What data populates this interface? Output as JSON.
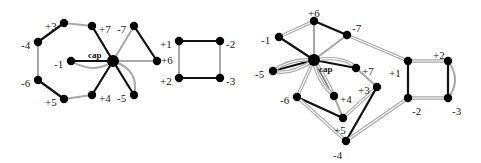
{
  "colors": {
    "black": "#111111",
    "gray": "#a8a8a8",
    "node": "#000000"
  },
  "diagrams": [
    {
      "name": "left-graph",
      "nodes": [
        {
          "id": "p3",
          "label": "+3",
          "x": 64,
          "y": 23,
          "lx": 45,
          "ly": 27
        },
        {
          "id": "m4",
          "label": "-4",
          "x": 38,
          "y": 42,
          "lx": 21,
          "ly": 46
        },
        {
          "id": "m1",
          "label": "-1",
          "x": 71,
          "y": 61,
          "lx": 54,
          "ly": 65
        },
        {
          "id": "m6",
          "label": "-6",
          "x": 38,
          "y": 80,
          "lx": 21,
          "ly": 84
        },
        {
          "id": "p5",
          "label": "+5",
          "x": 64,
          "y": 99,
          "lx": 45,
          "ly": 103
        },
        {
          "id": "p7",
          "label": "+7",
          "x": 92,
          "y": 26,
          "lx": 99,
          "ly": 30
        },
        {
          "id": "m7",
          "label": "-7",
          "x": 134,
          "y": 26,
          "lx": 117,
          "ly": 30
        },
        {
          "id": "cap",
          "label": "cap",
          "x": 113,
          "y": 61,
          "lx": 88,
          "ly": 56,
          "big": true
        },
        {
          "id": "p6",
          "label": "+6",
          "x": 157,
          "y": 61,
          "lx": 161,
          "ly": 61
        },
        {
          "id": "p4",
          "label": "+4",
          "x": 92,
          "y": 95,
          "lx": 99,
          "ly": 99
        },
        {
          "id": "m5",
          "label": "-5",
          "x": 134,
          "y": 95,
          "lx": 117,
          "ly": 99
        },
        {
          "id": "p1",
          "label": "+1",
          "x": 179,
          "y": 41,
          "lx": 160,
          "ly": 45
        },
        {
          "id": "m2",
          "label": "-2",
          "x": 220,
          "y": 41,
          "lx": 226,
          "ly": 45
        },
        {
          "id": "p2",
          "label": "+2",
          "x": 179,
          "y": 78,
          "lx": 160,
          "ly": 82
        },
        {
          "id": "m3",
          "label": "-3",
          "x": 220,
          "y": 78,
          "lx": 226,
          "ly": 82
        }
      ],
      "edges": [
        {
          "a": "p3",
          "b": "m4",
          "c": "black"
        },
        {
          "a": "p3",
          "b": "p7",
          "c": "gray"
        },
        {
          "a": "m4",
          "b": "m6",
          "c": "gray"
        },
        {
          "a": "m6",
          "b": "p5",
          "c": "black"
        },
        {
          "a": "p5",
          "b": "p4",
          "c": "gray"
        },
        {
          "a": "p4",
          "b": "cap",
          "c": "black"
        },
        {
          "a": "p7",
          "b": "cap",
          "c": "black"
        },
        {
          "a": "cap",
          "b": "m7",
          "c": "gray"
        },
        {
          "a": "m7",
          "b": "p6",
          "c": "black"
        },
        {
          "a": "cap",
          "b": "p6",
          "c": "gray"
        },
        {
          "a": "cap",
          "b": "m1",
          "c": "black"
        },
        {
          "a": "cap",
          "b": "m5",
          "c": "black"
        },
        {
          "a": "p1",
          "b": "m2",
          "c": "black"
        },
        {
          "a": "p2",
          "b": "m3",
          "c": "black"
        },
        {
          "a": "p1",
          "b": "p2",
          "c": "gray"
        },
        {
          "a": "m2",
          "b": "m3",
          "c": "gray"
        }
      ],
      "curves": [
        {
          "d": "M71,61 Q95,75 113,61",
          "c": "gray"
        },
        {
          "d": "M113,61 Q140,70 134,95",
          "c": "gray"
        }
      ]
    },
    {
      "name": "right-graph",
      "nodes": [
        {
          "id": "p6",
          "label": "+6",
          "x": 314,
          "y": 21,
          "lx": 308,
          "ly": 14
        },
        {
          "id": "m1",
          "label": "-1",
          "x": 279,
          "y": 37,
          "lx": 261,
          "ly": 41
        },
        {
          "id": "m7",
          "label": "-7",
          "x": 347,
          "y": 35,
          "lx": 352,
          "ly": 29
        },
        {
          "id": "cap",
          "label": "cap",
          "x": 314,
          "y": 60,
          "lx": 319,
          "ly": 70,
          "big": true
        },
        {
          "id": "m5",
          "label": "-5",
          "x": 273,
          "y": 71,
          "lx": 255,
          "ly": 75
        },
        {
          "id": "p7",
          "label": "+7",
          "x": 356,
          "y": 68,
          "lx": 362,
          "ly": 72
        },
        {
          "id": "m6",
          "label": "-6",
          "x": 297,
          "y": 97,
          "lx": 280,
          "ly": 101
        },
        {
          "id": "p4",
          "label": "+4",
          "x": 334,
          "y": 96,
          "lx": 340,
          "ly": 100
        },
        {
          "id": "p3",
          "label": "+3",
          "x": 377,
          "y": 87,
          "lx": 358,
          "ly": 91
        },
        {
          "id": "p5",
          "label": "+5",
          "x": 343,
          "y": 118,
          "lx": 334,
          "ly": 131
        },
        {
          "id": "m4",
          "label": "-4",
          "x": 346,
          "y": 141,
          "lx": 333,
          "ly": 156
        },
        {
          "id": "p1",
          "label": "+1",
          "x": 408,
          "y": 61,
          "lx": 389,
          "ly": 74
        },
        {
          "id": "p2",
          "label": "+2",
          "x": 448,
          "y": 61,
          "lx": 433,
          "ly": 56
        },
        {
          "id": "m2",
          "label": "-2",
          "x": 408,
          "y": 98,
          "lx": 412,
          "ly": 112
        },
        {
          "id": "m3",
          "label": "-3",
          "x": 448,
          "y": 98,
          "lx": 452,
          "ly": 112
        }
      ],
      "edges": [
        {
          "a": "m1",
          "b": "p6",
          "c": "gray2"
        },
        {
          "a": "p6",
          "b": "m7",
          "c": "black"
        },
        {
          "a": "p6",
          "b": "cap",
          "c": "gray"
        },
        {
          "a": "m7",
          "b": "cap",
          "c": "gray"
        },
        {
          "a": "m7",
          "b": "p1",
          "c": "gray2"
        },
        {
          "a": "m1",
          "b": "cap",
          "c": "black"
        },
        {
          "a": "cap",
          "b": "m5",
          "c": "black"
        },
        {
          "a": "cap",
          "b": "p7",
          "c": "black"
        },
        {
          "a": "cap",
          "b": "p4",
          "c": "black"
        },
        {
          "a": "cap",
          "b": "m6",
          "c": "gray2"
        },
        {
          "a": "m6",
          "b": "p5",
          "c": "black"
        },
        {
          "a": "m6",
          "b": "m4",
          "c": "gray2"
        },
        {
          "a": "p4",
          "b": "p5",
          "c": "gray"
        },
        {
          "a": "p7",
          "b": "p3",
          "c": "gray"
        },
        {
          "a": "p3",
          "b": "p5",
          "c": "gray2"
        },
        {
          "a": "p3",
          "b": "m4",
          "c": "black"
        },
        {
          "a": "m4",
          "b": "m2",
          "c": "gray2"
        },
        {
          "a": "p1",
          "b": "m2",
          "c": "black"
        },
        {
          "a": "p1",
          "b": "p2",
          "c": "gray2"
        },
        {
          "a": "m2",
          "b": "m3",
          "c": "gray2"
        },
        {
          "a": "p2",
          "b": "m3",
          "c": "black"
        }
      ],
      "curves": [
        {
          "d": "M314,60 Q290,58 273,71",
          "c": "gray2"
        },
        {
          "d": "M314,60 Q290,76 273,71",
          "c": "gray2"
        },
        {
          "d": "M314,60 Q345,55 356,68",
          "c": "gray2"
        },
        {
          "d": "M314,60 Q325,75 334,96",
          "c": "gray2"
        },
        {
          "d": "M314,60 Q316,80 334,96",
          "c": "gray2"
        },
        {
          "d": "M448,61 Q462,80 448,98",
          "c": "gray"
        }
      ]
    }
  ]
}
